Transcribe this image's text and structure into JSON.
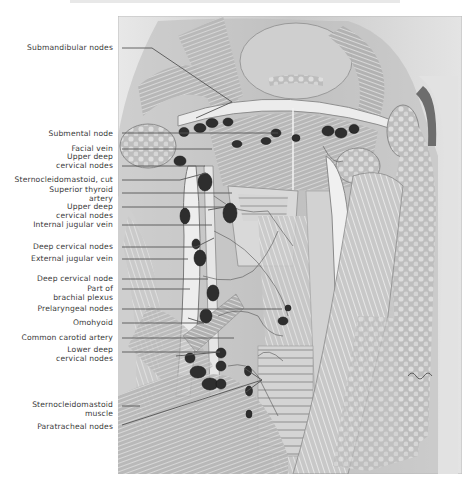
{
  "figure": {
    "palette": {
      "paper": "#ffffff",
      "ink": "#3a3a3a",
      "tissue_light": "#dcdcdc",
      "tissue_mid": "#a8a8a8",
      "tissue_dark": "#5e5e5e",
      "node": "#2e2e2e",
      "leader": "#555555"
    }
  },
  "labels": [
    {
      "id": "submandibular-nodes",
      "lines": [
        "Submandibular nodes"
      ],
      "y": 44,
      "leader": [
        [
          122,
          48
        ],
        [
          152,
          48
        ],
        [
          232,
          102
        ]
      ]
    },
    {
      "id": "submental-node",
      "lines": [
        "Submental node"
      ],
      "y": 130,
      "leader": [
        [
          122,
          133
        ],
        [
          278,
          133
        ]
      ]
    },
    {
      "id": "facial-vein",
      "lines": [
        "Facial vein"
      ],
      "y": 145,
      "leader": [
        [
          122,
          149
        ],
        [
          212,
          149
        ]
      ]
    },
    {
      "id": "upper-deep-cervical-nodes-1",
      "lines": [
        "Upper deep",
        "cervical nodes"
      ],
      "y": 153,
      "leader": [
        [
          122,
          166
        ],
        [
          205,
          166
        ]
      ]
    },
    {
      "id": "sternocleidomastoid-cut",
      "lines": [
        "Sternocleidomastoid, cut"
      ],
      "y": 176,
      "leader": [
        [
          122,
          180
        ],
        [
          180,
          180
        ]
      ]
    },
    {
      "id": "superior-thyroid-artery",
      "lines": [
        "Superior thyroid",
        "artery"
      ],
      "y": 186,
      "leader": [
        [
          122,
          193
        ],
        [
          232,
          193
        ]
      ]
    },
    {
      "id": "upper-deep-cervical-nodes-2",
      "lines": [
        "Upper deep",
        "cervical nodes"
      ],
      "y": 203,
      "leader": [
        [
          122,
          207
        ],
        [
          225,
          207
        ]
      ]
    },
    {
      "id": "internal-jugular-vein",
      "lines": [
        "Internal jugular vein"
      ],
      "y": 221,
      "leader": [
        [
          122,
          225
        ],
        [
          212,
          225
        ]
      ]
    },
    {
      "id": "deep-cervical-nodes",
      "lines": [
        "Deep cervical nodes"
      ],
      "y": 243,
      "leader": [
        [
          122,
          247
        ],
        [
          196,
          247
        ]
      ]
    },
    {
      "id": "external-jugular-vein",
      "lines": [
        "External jugular vein"
      ],
      "y": 255,
      "leader": [
        [
          122,
          259
        ],
        [
          188,
          259
        ]
      ]
    },
    {
      "id": "deep-cervical-node",
      "lines": [
        "Deep cervical node"
      ],
      "y": 275,
      "leader": [
        [
          122,
          279
        ],
        [
          208,
          279
        ]
      ]
    },
    {
      "id": "part-of-brachial-plexus",
      "lines": [
        "Part of",
        "brachial plexus"
      ],
      "y": 285,
      "leader": [
        [
          122,
          289
        ],
        [
          190,
          289
        ]
      ]
    },
    {
      "id": "prelaryngeal-nodes",
      "lines": [
        "Prelaryngeal nodes"
      ],
      "y": 305,
      "leader": [
        [
          122,
          309
        ],
        [
          282,
          309
        ]
      ]
    },
    {
      "id": "omohyoid",
      "lines": [
        "Omohyoid"
      ],
      "y": 319,
      "leader": [
        [
          122,
          323
        ],
        [
          204,
          323
        ]
      ]
    },
    {
      "id": "common-carotid-artery",
      "lines": [
        "Common carotid artery"
      ],
      "y": 334,
      "leader": [
        [
          122,
          338
        ],
        [
          234,
          338
        ]
      ]
    },
    {
      "id": "lower-deep-cervical-nodes",
      "lines": [
        "Lower deep",
        "cervical nodes"
      ],
      "y": 346,
      "leader": [
        [
          122,
          352
        ],
        [
          220,
          352
        ]
      ]
    },
    {
      "id": "sternocleidomastoid-muscle",
      "lines": [
        "Sternocleidomastoid",
        "muscle"
      ],
      "y": 401,
      "leader": [
        [
          122,
          406
        ],
        [
          140,
          406
        ]
      ]
    },
    {
      "id": "paratracheal-nodes",
      "lines": [
        "Paratracheal nodes"
      ],
      "y": 423,
      "leader": [
        [
          122,
          425
        ],
        [
          262,
          380
        ]
      ]
    }
  ],
  "extra_leaders": [
    [
      [
        232,
        102
      ],
      [
        196,
        118
      ]
    ],
    [
      [
        262,
        380
      ],
      [
        246,
        392
      ]
    ],
    [
      [
        262,
        380
      ],
      [
        244,
        368
      ]
    ],
    [
      [
        180,
        180
      ],
      [
        206,
        173
      ]
    ],
    [
      [
        225,
        207
      ],
      [
        208,
        210
      ]
    ],
    [
      [
        196,
        247
      ],
      [
        214,
        238
      ]
    ],
    [
      [
        204,
        323
      ],
      [
        188,
        318
      ]
    ],
    [
      [
        220,
        352
      ],
      [
        176,
        356
      ]
    ]
  ]
}
